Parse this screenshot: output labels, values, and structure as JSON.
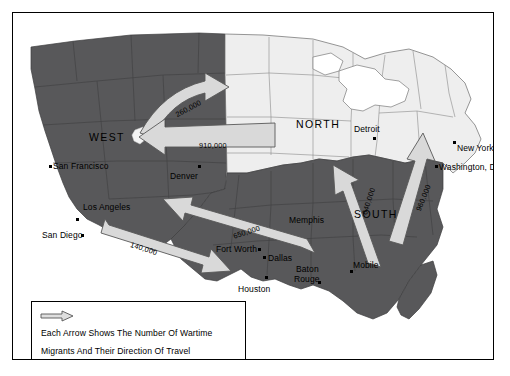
{
  "figure": {
    "background_color": "#ffffff",
    "frame_color": "#000000"
  },
  "colors": {
    "region_dark": "#58585a",
    "region_light": "#d2d2d2",
    "region_white": "#f0f0f0",
    "arrow_fill": "#d9d9d9",
    "arrow_stroke": "#4a4a4a",
    "outline": "#000000",
    "text": "#000000"
  },
  "regions": [
    {
      "name": "WEST",
      "label": "WEST",
      "shade": "dark",
      "x": 76,
      "y": 119
    },
    {
      "name": "NORTH",
      "label": "NORTH",
      "shade": "white",
      "x": 283,
      "y": 106
    },
    {
      "name": "SOUTH",
      "label": "SOUTH",
      "shade": "dark",
      "x": 341,
      "y": 196
    }
  ],
  "cities": [
    {
      "name": "San Francisco",
      "label": "San Francisco",
      "dot_x": 36,
      "dot_y": 152,
      "label_x": 40,
      "label_y": 149,
      "anchor": "left"
    },
    {
      "name": "Los Angeles",
      "label": "Los Angeles",
      "dot_x": 63,
      "dot_y": 205,
      "label_x": 70,
      "label_y": 190,
      "anchor": "left"
    },
    {
      "name": "San Diego",
      "label": "San Diego",
      "dot_x": 68,
      "dot_y": 221,
      "label_x": 29,
      "label_y": 218,
      "anchor": "left"
    },
    {
      "name": "Denver",
      "label": "Denver",
      "dot_x": 185,
      "dot_y": 152,
      "label_x": 157,
      "label_y": 159,
      "anchor": "left"
    },
    {
      "name": "Fort Worth",
      "label": "Fort Worth",
      "dot_x": 245,
      "dot_y": 235,
      "label_x": 203,
      "label_y": 232,
      "anchor": "left"
    },
    {
      "name": "Dallas",
      "label": "Dallas",
      "dot_x": 250,
      "dot_y": 243,
      "label_x": 255,
      "label_y": 241,
      "anchor": "left"
    },
    {
      "name": "Houston",
      "label": "Houston",
      "dot_x": 252,
      "dot_y": 263,
      "label_x": 225,
      "label_y": 272,
      "anchor": "left"
    },
    {
      "name": "Baton Rouge",
      "label": "Baton",
      "dot_x": 305,
      "dot_y": 268,
      "label_x": 283,
      "label_y": 252,
      "anchor": "left"
    },
    {
      "name": "Baton Rouge Line2",
      "label": "Rouge",
      "dot_x": -1,
      "dot_y": -1,
      "label_x": 281,
      "label_y": 262,
      "anchor": "left"
    },
    {
      "name": "Memphis",
      "label": "Memphis",
      "dot_x": -1,
      "dot_y": -1,
      "label_x": 276,
      "label_y": 203,
      "anchor": "left"
    },
    {
      "name": "Mobile",
      "label": "Mobile",
      "dot_x": 337,
      "dot_y": 257,
      "label_x": 340,
      "label_y": 248,
      "anchor": "left"
    },
    {
      "name": "Detroit",
      "label": "Detroit",
      "dot_x": 360,
      "dot_y": 124,
      "label_x": 341,
      "label_y": 112,
      "anchor": "left"
    },
    {
      "name": "New York",
      "label": "New York",
      "dot_x": 440,
      "dot_y": 128,
      "label_x": 444,
      "label_y": 131,
      "anchor": "left"
    },
    {
      "name": "Washington, D.C.",
      "label": "Washington, D.C.",
      "dot_x": 422,
      "dot_y": 152,
      "label_x": 426,
      "label_y": 150,
      "anchor": "left"
    }
  ],
  "migration_flows": [
    {
      "name": "west-to-north",
      "value": "260,000",
      "origin": "WEST",
      "destination": "NORTH",
      "label_x": 161,
      "label_y": 98,
      "rotation": -28
    },
    {
      "name": "north-to-west",
      "value": "910,000",
      "origin": "NORTH",
      "destination": "WEST",
      "label_x": 186,
      "label_y": 128,
      "rotation": 0
    },
    {
      "name": "south-to-west-upper",
      "value": "650,000",
      "origin": "SOUTH",
      "destination": "WEST",
      "label_x": 219,
      "label_y": 219,
      "rotation": -18
    },
    {
      "name": "south-to-west-lower",
      "value": "140,000",
      "origin": "SOUTH",
      "destination": "WEST",
      "label_x": 119,
      "label_y": 227,
      "rotation": 18
    },
    {
      "name": "south-to-north-left",
      "value": "640,000",
      "origin": "SOUTH",
      "destination": "NORTH",
      "label_x": 347,
      "label_y": 200,
      "rotation": -72
    },
    {
      "name": "south-to-north-right",
      "value": "960,000",
      "origin": "SOUTH",
      "destination": "NORTH",
      "label_x": 401,
      "label_y": 196,
      "rotation": -68
    }
  ],
  "legend": {
    "arrow_icon": "right-arrow-icon",
    "line1": "Each Arrow Shows The Number Of Wartime",
    "line2": "Migrants  And Their Direction Of Travel"
  }
}
